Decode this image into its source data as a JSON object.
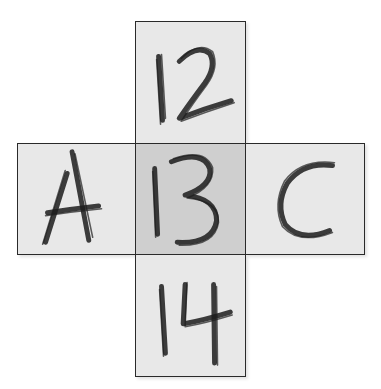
{
  "diagram": {
    "type": "cross-grid",
    "cells": [
      {
        "id": "top",
        "label": "12",
        "position": "top"
      },
      {
        "id": "left",
        "label": "A",
        "position": "left"
      },
      {
        "id": "center",
        "label": "13",
        "position": "center",
        "alt_reading": "B"
      },
      {
        "id": "right",
        "label": "C",
        "position": "right"
      },
      {
        "id": "bottom",
        "label": "14",
        "position": "bottom"
      }
    ],
    "colors": {
      "border": "#2a2a2a",
      "cell_fill": "#e8e8e8",
      "center_fill": "#cfcfcf",
      "ink": "#1c1c1c"
    },
    "caption": "Ambiguous center figure read as 'B' horizontally and '13' vertically"
  }
}
